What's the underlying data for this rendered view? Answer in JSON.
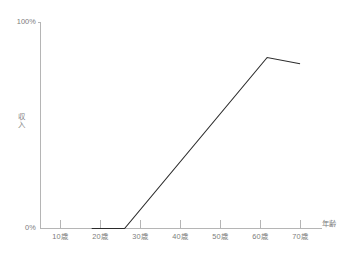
{
  "chart_data": {
    "type": "line",
    "title": "",
    "subtitle": "",
    "xlabel": "年齢",
    "ylabel": "収入",
    "xlim": [
      0,
      77
    ],
    "ylim": [
      0,
      100
    ],
    "grid": false,
    "legend": null,
    "legend_position": "none",
    "x_tick_labels": [
      "10歳",
      "20歳",
      "30歳",
      "40歳",
      "50歳",
      "60歳",
      "70歳"
    ],
    "x_tick_values": [
      10,
      20,
      30,
      40,
      50,
      60,
      70
    ],
    "y_tick_labels": [
      "0%",
      "100%"
    ],
    "y_tick_values": [
      0,
      100
    ],
    "series": [
      {
        "name": "収入",
        "color": "#2b2b2b",
        "x": [
          14,
          23,
          62,
          71
        ],
        "values": [
          0,
          0,
          83,
          80
        ],
        "annotations": [
          "0% from age 14 to 23",
          "rises linearly from age 23 to peak ~83% near age 62",
          "declines slightly to ~80% by age 71"
        ]
      }
    ]
  },
  "axis": {
    "value_top": "100%",
    "value_bottom": "0%",
    "y_title": "収入",
    "x_title": "年齢",
    "ticks": [
      {
        "label": "10歳"
      },
      {
        "label": "20歳"
      },
      {
        "label": "30歳"
      },
      {
        "label": "40歳"
      },
      {
        "label": "50歳"
      },
      {
        "label": "60歳"
      },
      {
        "label": "70歳"
      }
    ]
  },
  "colors": {
    "axis": "#b5b5b5",
    "data_line": "#2b2b2b",
    "text": "#7d7d7d",
    "background": "#ffffff"
  }
}
